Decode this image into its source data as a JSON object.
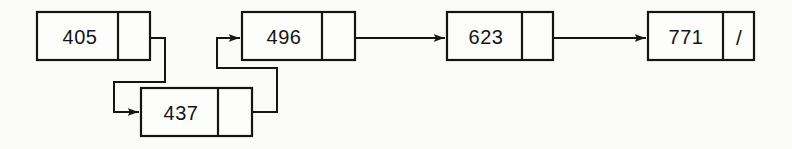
{
  "diagram": {
    "kind": "singly-linked-list",
    "background_color": "#fbfbfa",
    "ink_color": "#141414",
    "node_fill_color": "#fdfdfc",
    "null_symbol": "/",
    "nodes": [
      {
        "id": "node-405",
        "value": "405",
        "x": 37,
        "y": 12,
        "width": 113,
        "height": 48,
        "divider_offset": 81,
        "has_null_marker": false,
        "next": "node-437"
      },
      {
        "id": "node-437",
        "value": "437",
        "x": 141,
        "y": 88,
        "width": 111,
        "height": 48,
        "divider_offset": 77,
        "has_null_marker": false,
        "next": "node-496"
      },
      {
        "id": "node-496",
        "value": "496",
        "x": 242,
        "y": 12,
        "width": 113,
        "height": 48,
        "divider_offset": 80,
        "has_null_marker": false,
        "next": "node-623"
      },
      {
        "id": "node-623",
        "value": "623",
        "x": 447,
        "y": 12,
        "width": 106,
        "height": 48,
        "divider_offset": 75,
        "has_null_marker": false,
        "next": "node-771"
      },
      {
        "id": "node-771",
        "value": "771",
        "x": 648,
        "y": 12,
        "width": 106,
        "height": 48,
        "divider_offset": 75,
        "has_null_marker": true,
        "next": null
      }
    ],
    "links": [
      {
        "id": "link-405-437",
        "from": "node-405",
        "to": "node-437",
        "path": "M 133 38 L 165 38 L 165 82 L 114 82 L 114 112 L 138 112",
        "arrow_at": {
          "x": 141,
          "y": 112,
          "direction": "right"
        }
      },
      {
        "id": "link-437-496",
        "from": "node-437",
        "to": "node-496",
        "path": "M 233 112 L 277 112 L 277 68 L 217 68 L 217 38 L 239 38",
        "arrow_at": {
          "x": 242,
          "y": 38,
          "direction": "right"
        }
      },
      {
        "id": "link-496-623",
        "from": "node-496",
        "to": "node-623",
        "path": "M 338 38 L 444 38",
        "arrow_at": {
          "x": 447,
          "y": 38,
          "direction": "right"
        }
      },
      {
        "id": "link-623-771",
        "from": "node-623",
        "to": "node-771",
        "path": "M 537 38 L 645 38",
        "arrow_at": {
          "x": 648,
          "y": 38,
          "direction": "right"
        }
      }
    ]
  }
}
